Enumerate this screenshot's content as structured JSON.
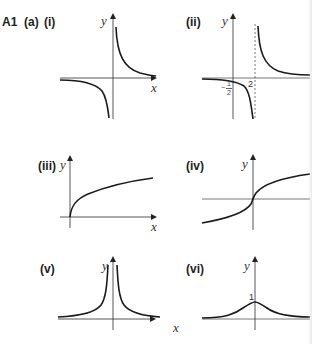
{
  "header": {
    "question": "A1",
    "part": "(a)"
  },
  "panels": [
    {
      "id": "i",
      "label": "(i)",
      "y_label": "y",
      "x_label": "x",
      "description": "reciprocal hyperbola y = 1/x, branches in quadrants I and III"
    },
    {
      "id": "ii",
      "label": "(ii)",
      "y_label": "y",
      "x_label": "",
      "description": "shifted hyperbola with vertical asymptote x = 2, y-intercept -1/2",
      "annotations": {
        "asymptote_x": "2",
        "y_intercept": "−",
        "y_intercept_num": "1",
        "y_intercept_den": "2"
      }
    },
    {
      "id": "iii",
      "label": "(iii)",
      "y_label": "y",
      "x_label": "x",
      "description": "square-root curve starting at origin"
    },
    {
      "id": "iv",
      "label": "(iv)",
      "y_label": "y",
      "x_label": "x",
      "description": "cube-root curve through origin"
    },
    {
      "id": "v",
      "label": "(v)",
      "y_label": "y",
      "x_label": "x",
      "description": "y = 1/x² style curve, both branches above x-axis with vertical asymptote at y-axis"
    },
    {
      "id": "vi",
      "label": "(vi)",
      "y_label": "y",
      "x_label": "",
      "description": "bell-shaped curve with maximum 1 at y-axis",
      "annotations": {
        "max_value": "1"
      }
    }
  ],
  "colors": {
    "curve": "#1a1a1a",
    "axis": "#333333",
    "asymptote": "#555555"
  }
}
